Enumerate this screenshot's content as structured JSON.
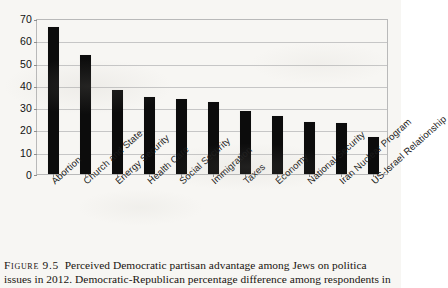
{
  "chart_data": {
    "type": "bar",
    "title": "",
    "xlabel": "",
    "ylabel": "",
    "ylim": [
      0,
      70
    ],
    "ytick_step": 10,
    "grid": true,
    "legend": null,
    "bar_color": "#0c0c0c",
    "gridline_color": "#c6c6c6",
    "frame_color": "#b9b9b9",
    "yticks": [
      "0",
      "10",
      "20",
      "30",
      "40",
      "50",
      "60",
      "70"
    ],
    "categories": [
      "Abortion",
      "Church and State",
      "Energy Security",
      "Health Care",
      "Social Security",
      "Immigration",
      "Taxes",
      "Economy",
      "National Security",
      "Iran Nuclear Program",
      "US-Israel Relationship"
    ],
    "values": [
      66,
      53.5,
      37.5,
      34.5,
      33.5,
      32.5,
      28.5,
      26,
      23.5,
      23,
      16.5
    ]
  },
  "caption": {
    "figure_number": "Figure 9.5",
    "line1": "Perceived Democratic partisan advantage among Jews on politica",
    "line2": "issues in 2012. Democratic-Republican percentage difference among respondents in"
  }
}
